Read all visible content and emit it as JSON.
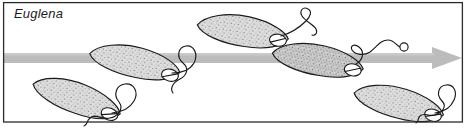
{
  "figure": {
    "organism_label": "Euglena",
    "kind": "scientific-illustration",
    "colors": {
      "background": "#ffffff",
      "frame_stroke": "#2b2b2b",
      "arrow_fill": "#b9b9b9",
      "cell_outline": "#1a1a1a",
      "cell_fill": "#d8d8d8",
      "stipple": "#6e6e6e",
      "flagellum_stroke": "#1a1a1a",
      "label_text": "#1d1d1d"
    },
    "frame": {
      "x": 3.5,
      "y": 2.5,
      "width": 459,
      "height": 120,
      "stroke_width": 1.2
    },
    "motion_arrow": {
      "name": "direction-of-movement-arrow",
      "direction": "right",
      "band_x": 4,
      "band_y": 53,
      "band_width": 428,
      "band_height": 10,
      "head_tip_x": 462,
      "head_top_y": 47,
      "head_bottom_y": 69,
      "head_base_x": 432
    },
    "cells": [
      {
        "id": "euglena-1",
        "position": "lower-left",
        "cx": 77,
        "cy": 98,
        "rx": 44,
        "ry": 15,
        "rotation": 22,
        "eyespot_side": "posterior-right",
        "flagellum": "large-loop-with-wavy-tail"
      },
      {
        "id": "euglena-2",
        "position": "left-center-on-arrow",
        "cx": 135,
        "cy": 63,
        "rx": 47,
        "ry": 17,
        "rotation": 14,
        "eyespot_side": "posterior-right",
        "flagellum": "loop-with-s-curve-tail"
      },
      {
        "id": "euglena-3",
        "position": "upper-center",
        "cx": 245,
        "cy": 31,
        "rx": 42,
        "ry": 15,
        "rotation": 11,
        "eyespot_side": "posterior-right",
        "flagellum": "long-curve-with-small-loop"
      },
      {
        "id": "euglena-4",
        "position": "right-center-on-arrow",
        "cx": 320,
        "cy": 60,
        "rx": 45,
        "ry": 16,
        "rotation": 12,
        "eyespot_side": "posterior-right",
        "flagellum": "wavy-with-terminal-ring"
      },
      {
        "id": "euglena-5",
        "position": "lower-right",
        "cx": 400,
        "cy": 103,
        "rx": 42,
        "ry": 14,
        "rotation": 16,
        "eyespot_side": "posterior-right",
        "flagellum": "large-loop-with-wavy-tail"
      }
    ]
  }
}
